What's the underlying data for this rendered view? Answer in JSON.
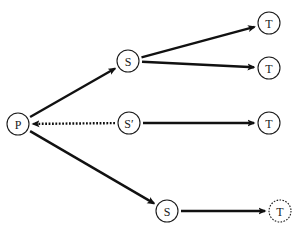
{
  "diagram": {
    "nodes": [
      {
        "id": "P",
        "label": "P",
        "x": 18,
        "y": 124,
        "style": "solid"
      },
      {
        "id": "S1",
        "label": "S",
        "x": 128,
        "y": 61,
        "style": "solid"
      },
      {
        "id": "S2",
        "label": "S′",
        "x": 129,
        "y": 123,
        "style": "solid"
      },
      {
        "id": "S3",
        "label": "S",
        "x": 167,
        "y": 211,
        "style": "solid"
      },
      {
        "id": "T1",
        "label": "T",
        "x": 269,
        "y": 23,
        "style": "solid"
      },
      {
        "id": "T2",
        "label": "T",
        "x": 269,
        "y": 68,
        "style": "solid"
      },
      {
        "id": "T3",
        "label": "T",
        "x": 269,
        "y": 123,
        "style": "solid"
      },
      {
        "id": "T4",
        "label": "T",
        "x": 280,
        "y": 211,
        "style": "dashed"
      }
    ],
    "edges": [
      {
        "from": "P",
        "to": "S1",
        "style": "solid"
      },
      {
        "from": "S2",
        "to": "P",
        "style": "dotted"
      },
      {
        "from": "P",
        "to": "S3",
        "style": "solid"
      },
      {
        "from": "S1",
        "to": "T1",
        "style": "solid"
      },
      {
        "from": "S1",
        "to": "T2",
        "style": "solid"
      },
      {
        "from": "S2",
        "to": "T3",
        "style": "solid"
      },
      {
        "from": "S3",
        "to": "T4",
        "style": "solid"
      }
    ],
    "node_radius": 11,
    "colors": {
      "stroke": "#111111",
      "background": "#ffffff"
    }
  }
}
